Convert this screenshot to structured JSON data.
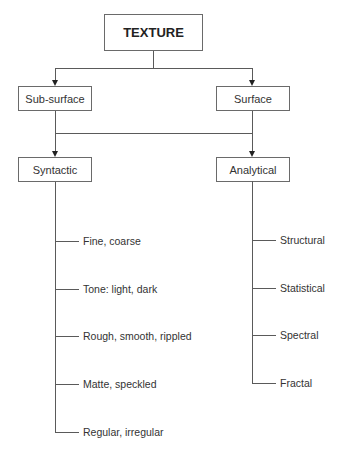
{
  "diagram": {
    "root": {
      "label": "TEXTURE"
    },
    "level1": [
      {
        "label": "Sub-surface"
      },
      {
        "label": "Surface"
      }
    ],
    "level2": [
      {
        "label": "Syntactic",
        "children": [
          "Fine, coarse",
          "Tone: light, dark",
          "Rough, smooth, rippled",
          "Matte, speckled",
          "Regular, irregular"
        ]
      },
      {
        "label": "Analytical",
        "children": [
          "Structural",
          "Statistical",
          "Spectral",
          "Fractal"
        ]
      }
    ]
  },
  "colors": {
    "line": "#5a5a5a",
    "box_border": "#6a6a6a",
    "text": "#333333",
    "background": "#ffffff"
  }
}
